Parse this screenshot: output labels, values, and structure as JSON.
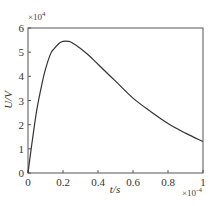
{
  "chart_data": {
    "type": "line",
    "title": "",
    "xlabel": "t/s",
    "ylabel": "U/V",
    "x_multiplier": {
      "base": "×10",
      "exp": "-4"
    },
    "y_multiplier": {
      "base": "×10",
      "exp": "4"
    },
    "xlim": [
      0,
      1
    ],
    "ylim": [
      0,
      6
    ],
    "x_ticks": [
      0,
      0.2,
      0.4,
      0.6,
      0.8,
      1
    ],
    "x_tick_labels": [
      "0",
      "0.2",
      "0.4",
      "0.6",
      "0.8",
      "1"
    ],
    "y_ticks": [
      0,
      1,
      2,
      3,
      4,
      5,
      6
    ],
    "y_tick_labels": [
      "0",
      "1",
      "2",
      "3",
      "4",
      "5",
      "6"
    ],
    "grid": false,
    "legend": null,
    "series": [
      {
        "name": "U",
        "color": "#333333",
        "x": [
          0,
          0.02,
          0.05,
          0.08,
          0.1,
          0.13,
          0.15,
          0.18,
          0.2,
          0.23,
          0.25,
          0.3,
          0.35,
          0.4,
          0.5,
          0.6,
          0.7,
          0.8,
          0.9,
          1.0
        ],
        "y": [
          0,
          1.1,
          2.6,
          3.7,
          4.3,
          4.95,
          5.15,
          5.38,
          5.45,
          5.45,
          5.4,
          5.15,
          4.85,
          4.5,
          3.8,
          3.1,
          2.55,
          2.05,
          1.65,
          1.3
        ]
      }
    ]
  }
}
